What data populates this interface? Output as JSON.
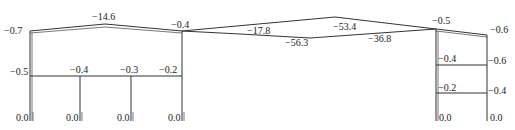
{
  "diagram": {
    "type": "bending-moment-diagram",
    "left_frame": {
      "roof_left": "−0.7",
      "roof_ridge": "−14.6",
      "roof_right": "−0.4",
      "beam_left": "−0.5",
      "beam_mid1": "−0.4",
      "beam_mid2": "−0.3",
      "beam_right": "−0.2",
      "base_values": [
        "0.0",
        "0.0",
        "0.0",
        "0.0"
      ]
    },
    "middle_span": {
      "upper_left": "−17.8",
      "upper_peak": "−53.4",
      "lower_mid": "−56.3",
      "lower_right": "−36.8"
    },
    "right_frame": {
      "roof_left": "−0.5",
      "roof_right": "−0.6",
      "beam1_left": "−0.4",
      "beam1_right": "−0.6",
      "beam2_left": "−0.2",
      "beam2_right": "−0.4",
      "base_values": [
        "0.0",
        "0.0"
      ]
    },
    "colors": {
      "line": "#333333",
      "text": "#222222",
      "background": "#ffffff"
    }
  }
}
